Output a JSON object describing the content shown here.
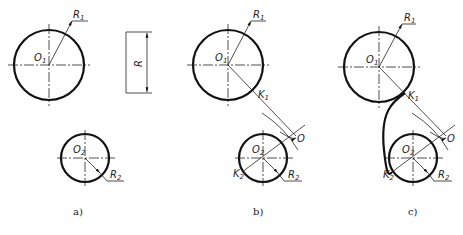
{
  "figure": {
    "panels": [
      {
        "caption": "a)",
        "circle1": {
          "center_label": "O",
          "center_sub": "1",
          "radius_label": "R",
          "radius_sub": "1"
        },
        "circle2": {
          "center_label": "O",
          "center_sub": "2",
          "radius_label": "R",
          "radius_sub": "2"
        },
        "dimension_box": {
          "label": "R"
        }
      },
      {
        "caption": "b)",
        "circle1": {
          "center_label": "O",
          "center_sub": "1",
          "radius_label": "R",
          "radius_sub": "1",
          "tangent_label": "K",
          "tangent_sub": "1"
        },
        "circle2": {
          "center_label": "O",
          "center_sub": "2",
          "radius_label": "R",
          "radius_sub": "2",
          "tangent_label": "K",
          "tangent_sub": "2"
        },
        "arc_center_label": "O"
      },
      {
        "caption": "c)",
        "circle1": {
          "center_label": "O",
          "center_sub": "1",
          "radius_label": "R",
          "radius_sub": "1",
          "tangent_label": "K",
          "tangent_sub": "1"
        },
        "circle2": {
          "center_label": "O",
          "center_sub": "2",
          "radius_label": "R",
          "radius_sub": "2",
          "tangent_label": "K",
          "tangent_sub": "2"
        },
        "arc_center_label": "O"
      }
    ],
    "colors": {
      "line": "#111111",
      "background": "#ffffff"
    }
  }
}
